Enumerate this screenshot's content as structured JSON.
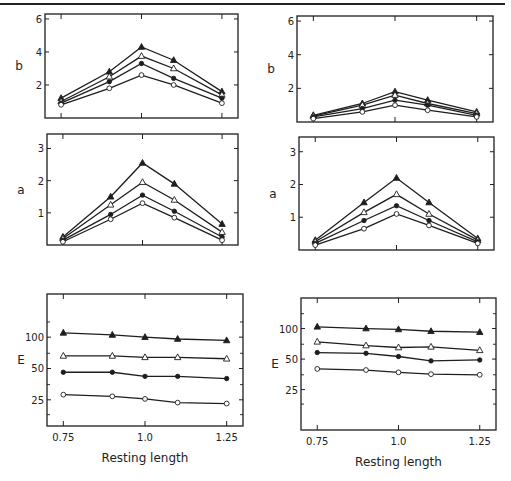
{
  "figure": {
    "x_title": "Resting length"
  },
  "chart_data": [
    {
      "id": "top-left",
      "type": "line",
      "ylabel": "b",
      "xlabel": "",
      "x": [
        0.75,
        0.9,
        1.0,
        1.1,
        1.25
      ],
      "xlim": [
        0.7,
        1.3
      ],
      "ylim": [
        0,
        6.3
      ],
      "yticks": [
        2,
        4,
        6
      ],
      "ytick_labels": [
        "2",
        "4",
        "6"
      ],
      "xticks": [
        0.75,
        1.0,
        1.25
      ],
      "xtick_labels": [],
      "box": {
        "left": 45,
        "top": 14,
        "right": 238,
        "bottom": 118
      },
      "series": [
        {
          "name": "filled-triangle",
          "marker": "filled-triangle",
          "values": [
            1.2,
            2.8,
            4.3,
            3.5,
            1.6
          ]
        },
        {
          "name": "open-triangle",
          "marker": "open-triangle",
          "values": [
            1.0,
            2.5,
            3.75,
            3.0,
            1.4
          ]
        },
        {
          "name": "filled-circle",
          "marker": "filled-circle",
          "values": [
            0.9,
            2.2,
            3.3,
            2.4,
            1.2
          ]
        },
        {
          "name": "open-circle",
          "marker": "open-circle",
          "values": [
            0.8,
            1.8,
            2.6,
            2.0,
            0.9
          ]
        }
      ]
    },
    {
      "id": "top-right",
      "type": "line",
      "ylabel": "b",
      "xlabel": "",
      "x": [
        0.75,
        0.9,
        1.0,
        1.1,
        1.25
      ],
      "xlim": [
        0.7,
        1.3
      ],
      "ylim": [
        0,
        6.3
      ],
      "yticks": [
        2,
        4,
        6
      ],
      "ytick_labels": [
        "2",
        "4",
        "6"
      ],
      "xticks": [
        0.75,
        1.0,
        1.25
      ],
      "xtick_labels": [],
      "box": {
        "left": 297,
        "top": 16,
        "right": 493,
        "bottom": 122
      },
      "series": [
        {
          "name": "filled-triangle",
          "marker": "filled-triangle",
          "values": [
            0.4,
            1.1,
            1.8,
            1.3,
            0.6
          ]
        },
        {
          "name": "open-triangle",
          "marker": "open-triangle",
          "values": [
            0.35,
            1.0,
            1.6,
            1.1,
            0.5
          ]
        },
        {
          "name": "filled-circle",
          "marker": "filled-circle",
          "values": [
            0.3,
            0.8,
            1.3,
            1.0,
            0.4
          ]
        },
        {
          "name": "open-circle",
          "marker": "open-circle",
          "values": [
            0.2,
            0.6,
            1.0,
            0.7,
            0.3
          ]
        }
      ]
    },
    {
      "id": "middle-left",
      "type": "line",
      "ylabel": "a",
      "xlabel": "",
      "x": [
        0.75,
        0.9,
        1.0,
        1.1,
        1.25
      ],
      "xlim": [
        0.7,
        1.3
      ],
      "ylim": [
        0,
        3.45
      ],
      "yticks": [
        1,
        2,
        3
      ],
      "ytick_labels": [
        "1",
        "2",
        "3"
      ],
      "xticks": [
        0.75,
        1.0,
        1.25
      ],
      "xtick_labels": [],
      "box": {
        "left": 47,
        "top": 134,
        "right": 238,
        "bottom": 245
      },
      "series": [
        {
          "name": "filled-triangle",
          "marker": "filled-triangle",
          "values": [
            0.25,
            1.5,
            2.55,
            1.9,
            0.65
          ]
        },
        {
          "name": "open-triangle",
          "marker": "open-triangle",
          "values": [
            0.2,
            1.25,
            1.95,
            1.4,
            0.4
          ]
        },
        {
          "name": "filled-circle",
          "marker": "filled-circle",
          "values": [
            0.15,
            0.95,
            1.55,
            1.05,
            0.25
          ]
        },
        {
          "name": "open-circle",
          "marker": "open-circle",
          "values": [
            0.1,
            0.8,
            1.3,
            0.85,
            0.15
          ]
        }
      ]
    },
    {
      "id": "middle-right",
      "type": "line",
      "ylabel": "a",
      "xlabel": "",
      "x": [
        0.75,
        0.9,
        1.0,
        1.1,
        1.25
      ],
      "xlim": [
        0.7,
        1.3
      ],
      "ylim": [
        0,
        3.45
      ],
      "yticks": [
        1,
        2,
        3
      ],
      "ytick_labels": [
        "1",
        "2",
        "3"
      ],
      "xticks": [
        0.75,
        1.0,
        1.25
      ],
      "xtick_labels": [],
      "box": {
        "left": 299,
        "top": 137,
        "right": 494,
        "bottom": 250
      },
      "series": [
        {
          "name": "filled-triangle",
          "marker": "filled-triangle",
          "values": [
            0.3,
            1.45,
            2.2,
            1.45,
            0.35
          ]
        },
        {
          "name": "open-triangle",
          "marker": "open-triangle",
          "values": [
            0.25,
            1.15,
            1.7,
            1.1,
            0.3
          ]
        },
        {
          "name": "filled-circle",
          "marker": "filled-circle",
          "values": [
            0.2,
            0.9,
            1.35,
            0.9,
            0.25
          ]
        },
        {
          "name": "open-circle",
          "marker": "open-circle",
          "values": [
            0.15,
            0.65,
            1.1,
            0.75,
            0.2
          ]
        }
      ]
    },
    {
      "id": "bottom-left",
      "type": "line",
      "ylabel": "E",
      "xlabel": "Resting length",
      "yscale": "log",
      "x": [
        0.75,
        0.9,
        1.0,
        1.1,
        1.25
      ],
      "xlim": [
        0.7,
        1.3
      ],
      "ylim": [
        14,
        260
      ],
      "yticks": [
        25,
        50,
        100
      ],
      "ytick_labels": [
        "25",
        "50",
        "100"
      ],
      "xticks": [
        0.75,
        1.0,
        1.25
      ],
      "xtick_labels": [
        "0.75",
        "1.0",
        "1.25"
      ],
      "box": {
        "left": 47,
        "top": 294,
        "right": 243,
        "bottom": 426
      },
      "series": [
        {
          "name": "filled-triangle",
          "marker": "filled-triangle",
          "values": [
            110,
            105,
            100,
            96,
            93
          ]
        },
        {
          "name": "open-triangle",
          "marker": "open-triangle",
          "values": [
            66,
            66,
            64,
            64,
            62
          ]
        },
        {
          "name": "filled-circle",
          "marker": "filled-circle",
          "values": [
            46,
            46,
            42,
            42,
            40
          ]
        },
        {
          "name": "open-circle",
          "marker": "open-circle",
          "values": [
            28,
            27,
            25.5,
            23.5,
            23
          ]
        }
      ]
    },
    {
      "id": "bottom-right",
      "type": "line",
      "ylabel": "E",
      "xlabel": "Resting length",
      "yscale": "log",
      "x": [
        0.75,
        0.9,
        1.0,
        1.1,
        1.25
      ],
      "xlim": [
        0.7,
        1.3
      ],
      "ylim": [
        10,
        200
      ],
      "yticks": [
        25,
        50,
        100
      ],
      "ytick_labels": [
        "25",
        "50",
        "100"
      ],
      "xticks": [
        0.75,
        1.0,
        1.25
      ],
      "xtick_labels": [
        "0.75",
        "1.0",
        "1.25"
      ],
      "box": {
        "left": 301,
        "top": 298,
        "right": 496,
        "bottom": 430
      },
      "series": [
        {
          "name": "filled-triangle",
          "marker": "filled-triangle",
          "values": [
            104,
            100,
            98,
            94,
            92
          ]
        },
        {
          "name": "open-triangle",
          "marker": "open-triangle",
          "values": [
            74,
            68,
            65,
            66,
            61
          ]
        },
        {
          "name": "filled-circle",
          "marker": "filled-circle",
          "values": [
            58,
            57,
            53,
            48,
            49
          ]
        },
        {
          "name": "open-circle",
          "marker": "open-circle",
          "values": [
            40,
            39,
            37,
            35.5,
            35
          ]
        }
      ]
    }
  ]
}
